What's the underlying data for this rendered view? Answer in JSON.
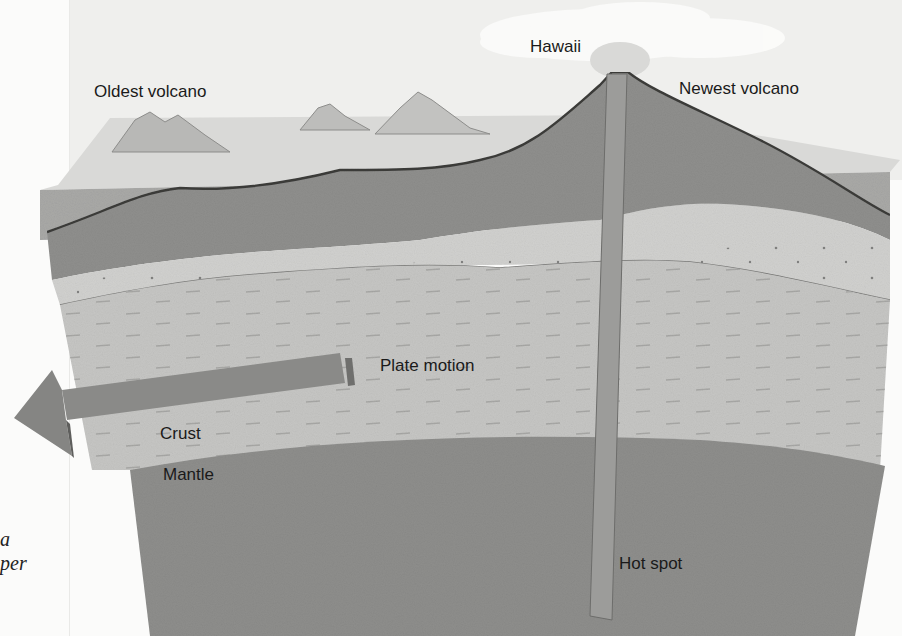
{
  "diagram": {
    "labels": {
      "oldest_volcano": "Oldest volcano",
      "hawaii": "Hawaii",
      "newest_volcano": "Newest volcano",
      "plate_motion": "Plate motion",
      "crust": "Crust",
      "mantle": "Mantle",
      "hot_spot": "Hot spot"
    },
    "caption_fragments": [
      "a",
      "per"
    ],
    "colors": {
      "sky": "#efefed",
      "cloud": "#fafaf9",
      "ocean": "#a9a9a7",
      "volcanic_rock": "#8c8c8a",
      "sediment": "#cdcdcb",
      "crust": "#c2c2c0",
      "mantle": "#8e8e8c",
      "hot_spot_plume": "#9a9a98",
      "arrow": "#8a8a88",
      "label_text": "#1a1a1a"
    }
  }
}
